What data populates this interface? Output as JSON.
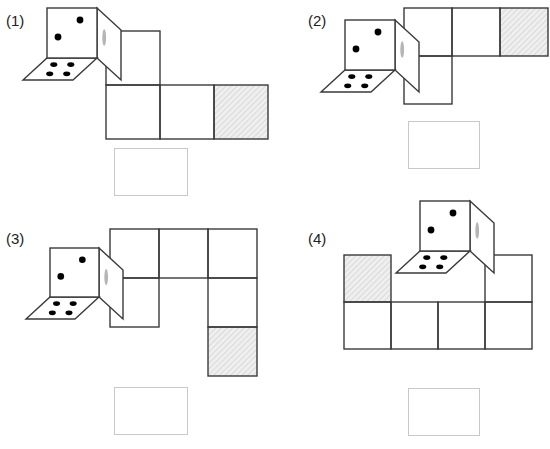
{
  "page": {
    "background_color": "#ffffff",
    "width": 550,
    "height": 449
  },
  "style": {
    "line_color": "#3a3a3a",
    "line_width": 1.4,
    "pip_color": "#000000",
    "shaded_fill": "#ededed",
    "hatch_color": "#d0d0d0",
    "marker_color": "#b5b5b5",
    "answer_box_border": "#c9c9c9"
  },
  "panels": [
    {
      "id": "panel-1",
      "label": "(1)",
      "label_x": 6,
      "label_y": 13,
      "die": {
        "front_face_pips": 2,
        "bottom_face_pips": 4,
        "edge_marker": "gray-oval-marker"
      },
      "net": {
        "cell_size": 54,
        "origin_x": 106,
        "origin_y": 31,
        "cells": [
          {
            "col": 0,
            "row": 0,
            "shaded": false
          },
          {
            "col": 0,
            "row": 1,
            "shaded": false
          },
          {
            "col": 1,
            "row": 1,
            "shaded": false
          },
          {
            "col": 2,
            "row": 1,
            "shaded": true
          }
        ]
      },
      "answer_box": {
        "x": 114,
        "y": 148,
        "w": 74,
        "h": 48
      }
    },
    {
      "id": "panel-2",
      "label": "(2)",
      "label_x": 308,
      "label_y": 13,
      "die": {
        "front_face_pips": 2,
        "bottom_face_pips": 4,
        "edge_marker": "gray-oval-marker"
      },
      "net": {
        "cell_size": 48,
        "origin_x": 404,
        "origin_y": 8,
        "cells": [
          {
            "col": 0,
            "row": 0,
            "shaded": false
          },
          {
            "col": 1,
            "row": 0,
            "shaded": false
          },
          {
            "col": 2,
            "row": 0,
            "shaded": true
          },
          {
            "col": 0,
            "row": 1,
            "shaded": false
          }
        ]
      },
      "answer_box": {
        "x": 408,
        "y": 121,
        "w": 72,
        "h": 48
      }
    },
    {
      "id": "panel-3",
      "label": "(3)",
      "label_x": 6,
      "label_y": 231,
      "die": {
        "front_face_pips": 2,
        "bottom_face_pips": 4,
        "edge_marker": "gray-oval-marker"
      },
      "net": {
        "cell_size": 49,
        "origin_x": 110,
        "origin_y": 229,
        "cells": [
          {
            "col": 0,
            "row": 0,
            "shaded": false
          },
          {
            "col": 1,
            "row": 0,
            "shaded": false
          },
          {
            "col": 2,
            "row": 0,
            "shaded": false
          },
          {
            "col": 0,
            "row": 1,
            "shaded": false
          },
          {
            "col": 2,
            "row": 1,
            "shaded": false
          },
          {
            "col": 2,
            "row": 2,
            "shaded": true
          }
        ]
      },
      "answer_box": {
        "x": 114,
        "y": 387,
        "w": 74,
        "h": 48
      }
    },
    {
      "id": "panel-4",
      "label": "(4)",
      "label_x": 308,
      "label_y": 231,
      "die": {
        "front_face_pips": 2,
        "bottom_face_pips": 4,
        "edge_marker": "gray-oval-marker"
      },
      "net": {
        "cell_size": 47,
        "origin_x": 344,
        "origin_y": 255,
        "cells": [
          {
            "col": 0,
            "row": 0,
            "shaded": true
          },
          {
            "col": 3,
            "row": 0,
            "shaded": false
          },
          {
            "col": 0,
            "row": 1,
            "shaded": false
          },
          {
            "col": 1,
            "row": 1,
            "shaded": false
          },
          {
            "col": 2,
            "row": 1,
            "shaded": false
          },
          {
            "col": 3,
            "row": 1,
            "shaded": false
          }
        ]
      },
      "answer_box": {
        "x": 408,
        "y": 388,
        "w": 72,
        "h": 48
      }
    }
  ],
  "dice_geometry": {
    "panel-1": {
      "x": 47,
      "y": 8,
      "w": 50,
      "skew_x": 24,
      "skew_y": 22
    },
    "panel-2": {
      "x": 345,
      "y": 20,
      "w": 50,
      "skew_x": 24,
      "skew_y": 22
    },
    "panel-3": {
      "x": 50,
      "y": 248,
      "w": 49,
      "skew_x": 24,
      "skew_y": 22
    },
    "panel-4": {
      "x": 420,
      "y": 201,
      "w": 50,
      "skew_x": 24,
      "skew_y": 22
    }
  }
}
